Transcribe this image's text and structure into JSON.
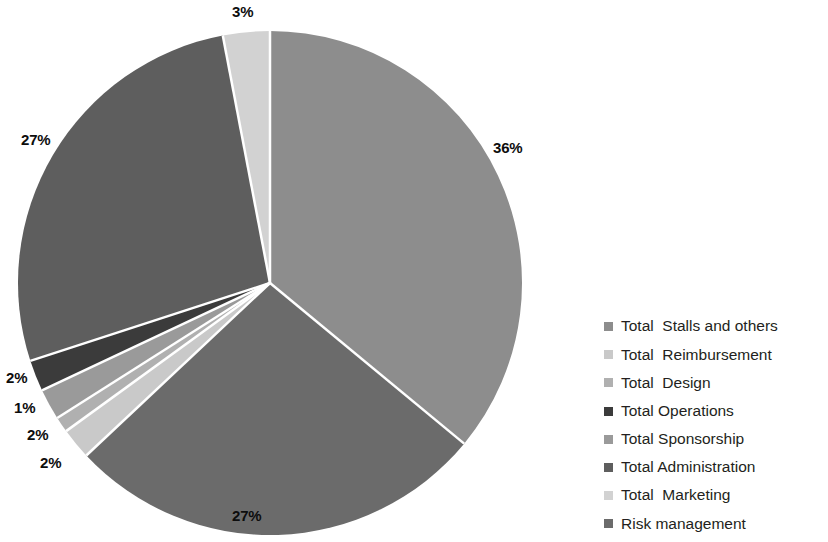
{
  "chart_data": {
    "type": "pie",
    "title": "",
    "subtitle": "",
    "xlabel": "",
    "ylabel": "",
    "grid": false,
    "legend_position": "right",
    "units": "percent",
    "start_angle_deg": 0,
    "direction": "clockwise",
    "categories": [
      "Total  Stalls and others",
      "Total  Reimbursement",
      "Total  Design",
      "Total Operations",
      "Total Sponsorship",
      "Total Administration",
      "Total  Marketing",
      "Risk management"
    ],
    "values": [
      36,
      2,
      1,
      2,
      2,
      27,
      3,
      27
    ],
    "data_labels": [
      "36%",
      "2%",
      "1%",
      "2%",
      "2%",
      "27%",
      "3%",
      "27%"
    ],
    "colors": [
      "#8d8d8d",
      "#c9c9c9",
      "#b0b0b0",
      "#3b3b3b",
      "#9a9a9a",
      "#5e5e5e",
      "#d2d2d2",
      "#6b6b6b"
    ],
    "slices": [
      {
        "label": "Total  Stalls and others",
        "value": 36,
        "data_label": "36%",
        "color": "#8d8d8d"
      },
      {
        "label": "Risk management",
        "value": 27,
        "data_label": "27%",
        "color": "#6b6b6b"
      },
      {
        "label": "Total  Reimbursement",
        "value": 2,
        "data_label": "2%",
        "color": "#c9c9c9"
      },
      {
        "label": "Total  Design",
        "value": 1,
        "data_label": "1%",
        "color": "#b0b0b0"
      },
      {
        "label": "Total Sponsorship",
        "value": 2,
        "data_label": "2%",
        "color": "#9a9a9a"
      },
      {
        "label": "Total Operations",
        "value": 2,
        "data_label": "2%",
        "color": "#3b3b3b"
      },
      {
        "label": "Total Administration",
        "value": 27,
        "data_label": "27%",
        "color": "#5e5e5e"
      },
      {
        "label": "Total  Marketing",
        "value": 3,
        "data_label": "3%",
        "color": "#d2d2d2"
      }
    ]
  },
  "pie": {
    "center_x": 270,
    "center_y": 283,
    "radius": 252,
    "separator_color": "#ffffff",
    "separator_width": 2.5
  },
  "labels": {
    "stalls_pct": "36%",
    "risk_pct": "27%",
    "reimbursement_pct": "2%",
    "design_pct": "1%",
    "sponsorship_pct": "2%",
    "operations_pct": "2%",
    "administration_pct": "27%",
    "marketing_pct": "3%"
  },
  "legend": {
    "items": [
      {
        "label": "Total  Stalls and others",
        "color": "#8d8d8d"
      },
      {
        "label": "Total  Reimbursement",
        "color": "#c9c9c9"
      },
      {
        "label": "Total  Design",
        "color": "#b0b0b0"
      },
      {
        "label": "Total Operations",
        "color": "#3b3b3b"
      },
      {
        "label": "Total Sponsorship",
        "color": "#9a9a9a"
      },
      {
        "label": "Total Administration",
        "color": "#5e5e5e"
      },
      {
        "label": "Total  Marketing",
        "color": "#d2d2d2"
      },
      {
        "label": "Risk management",
        "color": "#6b6b6b"
      }
    ]
  }
}
